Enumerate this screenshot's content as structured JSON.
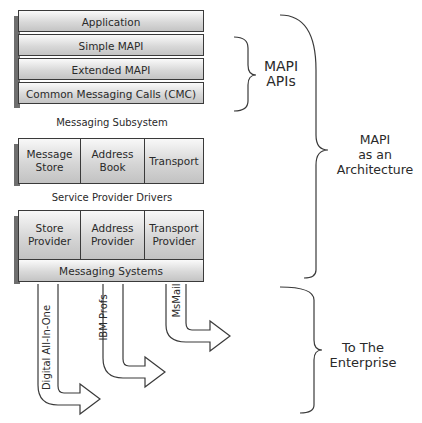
{
  "api_stack": {
    "layers": [
      "Application",
      "Simple MAPI",
      "Extended MAPI",
      "Common Messaging Calls (CMC)"
    ],
    "caption": "Messaging Subsystem"
  },
  "drivers": {
    "cells": [
      "Message\nStore",
      "Address\nBook",
      "Transport"
    ],
    "caption": "Service Provider Drivers"
  },
  "providers": {
    "cells": [
      "Store\nProvider",
      "Address\nProvider",
      "Transport\nProvider"
    ],
    "base": "Messaging Systems"
  },
  "arrows": [
    {
      "label": "Digital All-In-One"
    },
    {
      "label": "IBM Profs"
    },
    {
      "label": "MsMail"
    }
  ],
  "braces": {
    "apis": "MAPI\nAPIs",
    "architecture": "MAPI\nas an\nArchitecture",
    "enterprise": "To The\nEnterprise"
  },
  "colors": {
    "line": "#3a3a3a",
    "shadow": "#6e6e6e"
  }
}
